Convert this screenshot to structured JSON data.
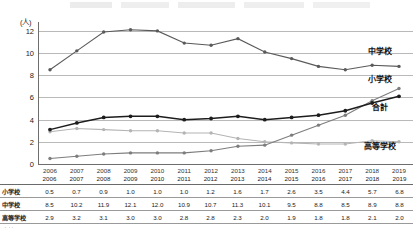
{
  "chart_data": {
    "type": "line",
    "title": "",
    "unit_label": "(人)",
    "xlabel": "",
    "ylabel": "",
    "ylim": [
      0,
      12.8
    ],
    "yticks": [
      0,
      2,
      4,
      6,
      8,
      10,
      12
    ],
    "grid": true,
    "legend_position": "right-inline",
    "categories": [
      "2006",
      "2007",
      "2008",
      "2009",
      "2010",
      "2011",
      "2012",
      "2013",
      "2014",
      "2015",
      "2016",
      "2017",
      "2018",
      "2019"
    ],
    "series": [
      {
        "name": "小学校",
        "color": "#7d7d7d",
        "values": [
          0.5,
          0.7,
          0.9,
          1.0,
          1.0,
          1.0,
          1.2,
          1.6,
          1.7,
          2.6,
          3.5,
          4.4,
          5.7,
          6.8
        ]
      },
      {
        "name": "中学校",
        "color": "#5a5a5a",
        "values": [
          8.5,
          10.2,
          11.9,
          12.1,
          12.0,
          10.9,
          10.7,
          11.3,
          10.1,
          9.5,
          8.8,
          8.5,
          8.9,
          8.8
        ]
      },
      {
        "name": "高等学校",
        "color": "#b4b4b4",
        "values": [
          2.9,
          3.2,
          3.1,
          3.0,
          3.0,
          2.8,
          2.8,
          2.3,
          2.0,
          1.9,
          1.8,
          1.8,
          2.1,
          2.0
        ]
      },
      {
        "name": "合計",
        "color": "#1d1d1d",
        "values": [
          3.1,
          3.7,
          4.2,
          4.3,
          4.3,
          4.0,
          4.1,
          4.3,
          4.0,
          4.2,
          4.4,
          4.8,
          5.5,
          6.1
        ]
      }
    ],
    "series_labels": [
      {
        "name": "中学校",
        "x": 368,
        "y": 45
      },
      {
        "name": "小学校",
        "x": 368,
        "y": 73
      },
      {
        "name": "合計",
        "x": 372,
        "y": 101
      },
      {
        "name": "高等学校",
        "x": 364,
        "y": 140
      }
    ]
  },
  "table": {
    "corner_label": "",
    "columns": [
      "2006",
      "2007",
      "2008",
      "2009",
      "2010",
      "2011",
      "2012",
      "2013",
      "2014",
      "2015",
      "2016",
      "2017",
      "2018",
      "2019"
    ],
    "rows": [
      {
        "label": "小学校",
        "values": [
          "0.5",
          "0.7",
          "0.9",
          "1.0",
          "1.0",
          "1.0",
          "1.2",
          "1.6",
          "1.7",
          "2.6",
          "3.5",
          "4.4",
          "5.7",
          "6.8"
        ]
      },
      {
        "label": "中学校",
        "values": [
          "8.5",
          "10.2",
          "11.9",
          "12.1",
          "12.0",
          "10.9",
          "10.7",
          "11.3",
          "10.1",
          "9.5",
          "8.8",
          "8.5",
          "8.9",
          "8.8"
        ]
      },
      {
        "label": "高等学校",
        "values": [
          "2.9",
          "3.2",
          "3.1",
          "3.0",
          "3.0",
          "2.8",
          "2.8",
          "2.3",
          "2.0",
          "1.9",
          "1.8",
          "1.8",
          "2.1",
          "2.0"
        ]
      },
      {
        "label": "合計",
        "values": [
          "3.1",
          "3.7",
          "4.2",
          "4.3",
          "4.3",
          "4.0",
          "4.1",
          "4.3",
          "4.0",
          "4.2",
          "4.4",
          "4.8",
          "5.5",
          "6.1"
        ]
      }
    ]
  }
}
